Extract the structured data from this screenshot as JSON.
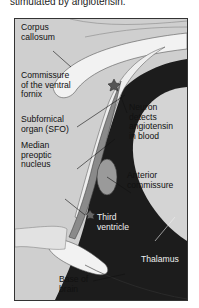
{
  "caption": "stimulated by angiotensin.",
  "diagram": {
    "colors": {
      "background": "#cfcfcf",
      "white_matter": "#f2f2f2",
      "ventricle": "#1c1c1c",
      "organ": "#8a8a8a",
      "thalamus": "#d4d4d4",
      "border": "#333333"
    },
    "labels": {
      "corpus_callosum": "Corpus\ncallosum",
      "commissure_ventral_fornix": "Commissure\nof the ventral\nfornix",
      "sfo": "Subfornical\norgan (SFO)",
      "median_preoptic": "Median\npreoptic\nnucleus",
      "neuron": "Neuron\ndetects\nangiotensin\nin blood",
      "anterior_commissure": "Anterior\ncommissure",
      "third_ventricle": "Third\nventricle",
      "thalamus": "Thalamus",
      "base_of_brain": "Base of\nbrain"
    }
  }
}
